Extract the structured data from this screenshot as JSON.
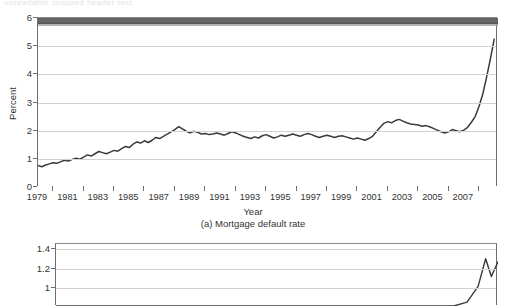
{
  "page": {
    "ghost_top_text": "unreadable cropped header text"
  },
  "chart_data": [
    {
      "id": "mortgage-default-rate",
      "type": "line",
      "title": "",
      "caption": "(a) Mortgage default rate",
      "xlabel": "Year",
      "ylabel": "Percent",
      "xlim": [
        1979,
        2009.25
      ],
      "ylim": [
        0,
        6
      ],
      "yticks": [
        0,
        1,
        2,
        3,
        4,
        5,
        6
      ],
      "ytick_labels": [
        "0",
        "1",
        "2",
        "3",
        "4",
        "5",
        "6"
      ],
      "xtick_labels": [
        "1979",
        "1981",
        "1983",
        "1985",
        "1987",
        "1989",
        "1991",
        "1993",
        "1995",
        "1997",
        "1999",
        "2001",
        "2003",
        "2005",
        "2007"
      ],
      "xtick_values": [
        1979,
        1981,
        1983,
        1985,
        1987,
        1989,
        1991,
        1993,
        1995,
        1997,
        1999,
        2001,
        2003,
        2005,
        2007
      ],
      "minor_xticks": [
        1980,
        1982,
        1984,
        1986,
        1988,
        1990,
        1992,
        1994,
        1996,
        1998,
        2000,
        2002,
        2004,
        2006,
        2008
      ],
      "grid": "horizontal",
      "legend": "none",
      "series": [
        {
          "name": "Mortgage default rate",
          "x": [
            1979.0,
            1979.25,
            1979.5,
            1979.75,
            1980.0,
            1980.25,
            1980.5,
            1980.75,
            1981.0,
            1981.25,
            1981.5,
            1981.75,
            1982.0,
            1982.25,
            1982.5,
            1982.75,
            1983.0,
            1983.25,
            1983.5,
            1983.75,
            1984.0,
            1984.25,
            1984.5,
            1984.75,
            1985.0,
            1985.25,
            1985.5,
            1985.75,
            1986.0,
            1986.25,
            1986.5,
            1986.75,
            1987.0,
            1987.25,
            1987.5,
            1987.75,
            1988.0,
            1988.25,
            1988.5,
            1988.75,
            1989.0,
            1989.25,
            1989.5,
            1989.75,
            1990.0,
            1990.25,
            1990.5,
            1990.75,
            1991.0,
            1991.25,
            1991.5,
            1991.75,
            1992.0,
            1992.25,
            1992.5,
            1992.75,
            1993.0,
            1993.25,
            1993.5,
            1993.75,
            1994.0,
            1994.25,
            1994.5,
            1994.75,
            1995.0,
            1995.25,
            1995.5,
            1995.75,
            1996.0,
            1996.25,
            1996.5,
            1996.75,
            1997.0,
            1997.25,
            1997.5,
            1997.75,
            1998.0,
            1998.25,
            1998.5,
            1998.75,
            1999.0,
            1999.25,
            1999.5,
            1999.75,
            2000.0,
            2000.25,
            2000.5,
            2000.75,
            2001.0,
            2001.25,
            2001.5,
            2001.75,
            2002.0,
            2002.25,
            2002.5,
            2002.75,
            2003.0,
            2003.25,
            2003.5,
            2003.75,
            2004.0,
            2004.25,
            2004.5,
            2004.75,
            2005.0,
            2005.25,
            2005.5,
            2005.75,
            2006.0,
            2006.25,
            2006.5,
            2006.75,
            2007.0,
            2007.25,
            2007.5,
            2007.75,
            2008.0,
            2008.25,
            2008.5,
            2008.75,
            2009.0
          ],
          "y": [
            0.76,
            0.72,
            0.78,
            0.82,
            0.86,
            0.84,
            0.9,
            0.95,
            0.92,
            0.98,
            1.02,
            0.99,
            1.06,
            1.14,
            1.1,
            1.18,
            1.26,
            1.22,
            1.18,
            1.24,
            1.3,
            1.27,
            1.36,
            1.44,
            1.4,
            1.52,
            1.6,
            1.56,
            1.64,
            1.58,
            1.66,
            1.76,
            1.72,
            1.8,
            1.88,
            1.96,
            2.04,
            2.14,
            2.06,
            1.98,
            1.92,
            1.98,
            1.94,
            1.88,
            1.9,
            1.86,
            1.88,
            1.92,
            1.88,
            1.84,
            1.9,
            1.96,
            1.92,
            1.86,
            1.8,
            1.76,
            1.72,
            1.78,
            1.74,
            1.82,
            1.86,
            1.8,
            1.74,
            1.78,
            1.84,
            1.8,
            1.84,
            1.88,
            1.84,
            1.8,
            1.86,
            1.9,
            1.86,
            1.8,
            1.76,
            1.8,
            1.84,
            1.8,
            1.76,
            1.8,
            1.82,
            1.78,
            1.74,
            1.7,
            1.74,
            1.7,
            1.66,
            1.72,
            1.8,
            1.96,
            2.12,
            2.26,
            2.32,
            2.28,
            2.36,
            2.4,
            2.34,
            2.28,
            2.24,
            2.22,
            2.2,
            2.16,
            2.18,
            2.14,
            2.08,
            2.02,
            1.96,
            1.92,
            1.96,
            2.04,
            2.0,
            1.96,
            2.02,
            2.12,
            2.3,
            2.5,
            2.86,
            3.3,
            3.9,
            4.55,
            5.25,
            5.62,
            5.72
          ]
        }
      ]
    },
    {
      "id": "panel-b-cropped",
      "type": "line",
      "title": "",
      "caption": "",
      "xlabel": "",
      "ylabel": "",
      "note": "panel cropped by image bottom edge",
      "ylim": [
        0.82,
        1.45
      ],
      "yticks": [
        1,
        1.2,
        1.4
      ],
      "ytick_labels": [
        "1",
        "1.2",
        "1.4"
      ],
      "grid": "horizontal",
      "legend": "none",
      "series": [
        {
          "name": "series-b",
          "x": [
            0,
            0.9,
            0.93,
            0.955,
            0.972,
            0.985,
            1.0
          ],
          "y": [
            0.82,
            0.82,
            0.86,
            1.02,
            1.3,
            1.12,
            1.27
          ]
        }
      ]
    }
  ]
}
